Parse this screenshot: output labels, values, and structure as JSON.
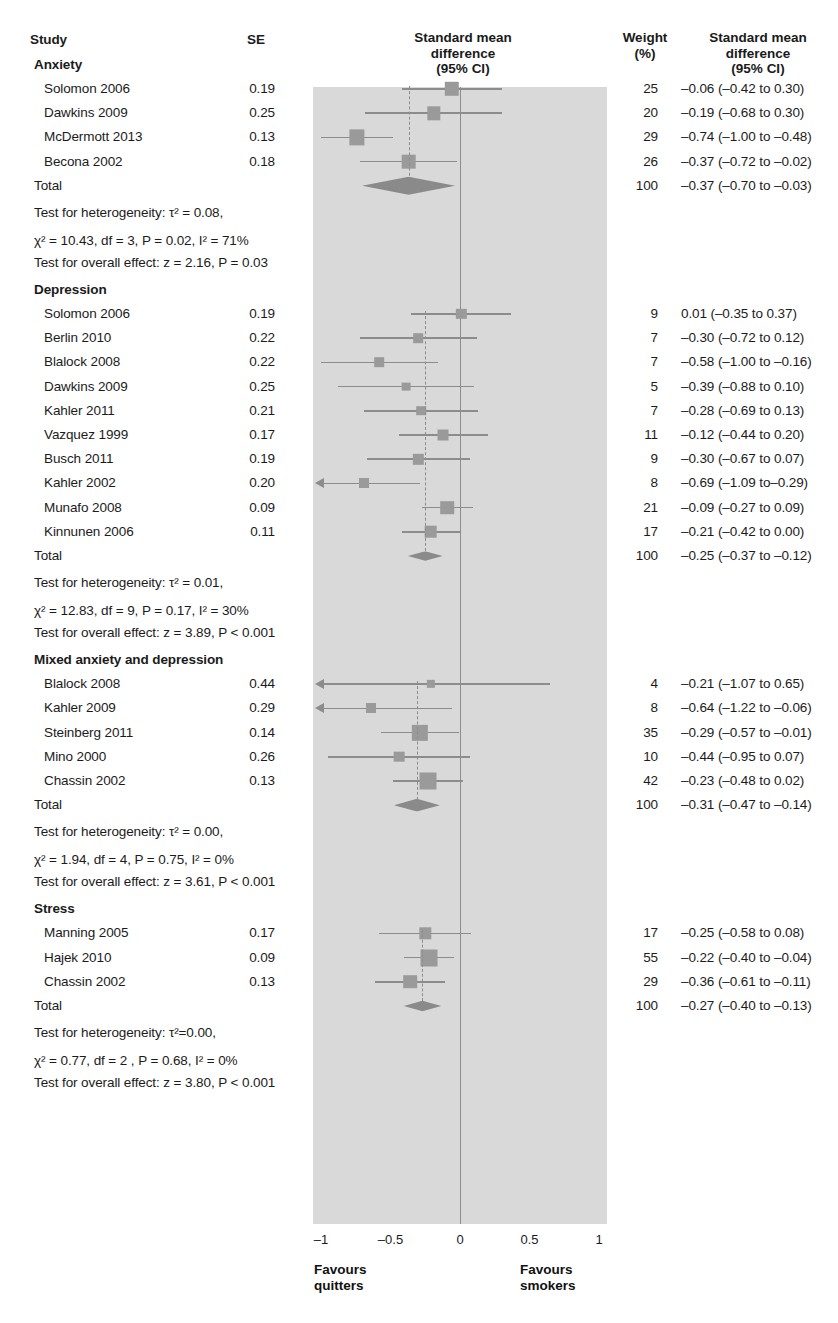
{
  "header": {
    "study": "Study",
    "se": "SE",
    "plot_title_line1": "Standard mean",
    "plot_title_line2": "difference",
    "plot_title_line3": "(95% CI)",
    "weight_line1": "Weight",
    "weight_line2": "(%)",
    "effect_line1": "Standard mean",
    "effect_line2": "difference",
    "effect_line3": "(95% CI)"
  },
  "axis": {
    "ticks": [
      "–1",
      "–0.5",
      "0",
      "0.5",
      "1"
    ],
    "tick_values": [
      -1,
      -0.5,
      0,
      0.5,
      1
    ],
    "favours_left_line1": "Favours",
    "favours_left_line2": "quitters",
    "favours_right_line1": "Favours",
    "favours_right_line2": "smokers"
  },
  "colors": {
    "plot_background": "#d9d9d9",
    "marker": "#9a9a9a",
    "line": "#8c8c8c",
    "diamond": "#8a8a8a",
    "text": "#1b1b1b"
  },
  "chart_data": {
    "type": "forest",
    "title": "Standard mean difference (95% CI)",
    "xlabel": "Standard mean difference",
    "xlim": [
      -1,
      1
    ],
    "grid": false,
    "null_line": 0,
    "groups": [
      {
        "name": "Anxiety",
        "studies": [
          {
            "study": "Solomon 2006",
            "se": "0.19",
            "weight": "25",
            "effect_text": "–0.06 (–0.42 to 0.30)",
            "estimate": -0.06,
            "ci_low": -0.42,
            "ci_high": 0.3,
            "weight_value": 25
          },
          {
            "study": "Dawkins 2009",
            "se": "0.25",
            "weight": "20",
            "effect_text": "–0.19 (–0.68 to 0.30)",
            "estimate": -0.19,
            "ci_low": -0.68,
            "ci_high": 0.3,
            "weight_value": 20
          },
          {
            "study": "McDermott 2013",
            "se": "0.13",
            "weight": "29",
            "effect_text": "–0.74 (–1.00 to –0.48)",
            "estimate": -0.74,
            "ci_low": -1.0,
            "ci_high": -0.48,
            "weight_value": 29
          },
          {
            "study": "Becona 2002",
            "se": "0.18",
            "weight": "26",
            "effect_text": "–0.37 (–0.72 to –0.02)",
            "estimate": -0.37,
            "ci_low": -0.72,
            "ci_high": -0.02,
            "weight_value": 26
          }
        ],
        "total": {
          "study": "Total",
          "weight": "100",
          "effect_text": "–0.37 (–0.70 to –0.03)",
          "estimate": -0.37,
          "ci_low": -0.7,
          "ci_high": -0.03
        },
        "heterogeneity_line1": "Test for heterogeneity: τ² = 0.08,",
        "heterogeneity_line2": "χ² = 10.43, df = 3, P = 0.02, I² = 71%",
        "overall_effect": "Test for overall effect: z = 2.16, P = 0.03"
      },
      {
        "name": "Depression",
        "studies": [
          {
            "study": "Solomon 2006",
            "se": "0.19",
            "weight": "9",
            "effect_text": "0.01 (–0.35 to 0.37)",
            "estimate": 0.01,
            "ci_low": -0.35,
            "ci_high": 0.37,
            "weight_value": 9
          },
          {
            "study": "Berlin 2010",
            "se": "0.22",
            "weight": "7",
            "effect_text": "–0.30 (–0.72 to 0.12)",
            "estimate": -0.3,
            "ci_low": -0.72,
            "ci_high": 0.12,
            "weight_value": 7
          },
          {
            "study": "Blalock 2008",
            "se": "0.22",
            "weight": "7",
            "effect_text": "–0.58 (–1.00 to –0.16)",
            "estimate": -0.58,
            "ci_low": -1.0,
            "ci_high": -0.16,
            "weight_value": 7
          },
          {
            "study": "Dawkins 2009",
            "se": "0.25",
            "weight": "5",
            "effect_text": "–0.39 (–0.88 to 0.10)",
            "estimate": -0.39,
            "ci_low": -0.88,
            "ci_high": 0.1,
            "weight_value": 5
          },
          {
            "study": "Kahler 2011",
            "se": "0.21",
            "weight": "7",
            "effect_text": "–0.28 (–0.69 to 0.13)",
            "estimate": -0.28,
            "ci_low": -0.69,
            "ci_high": 0.13,
            "weight_value": 7
          },
          {
            "study": "Vazquez 1999",
            "se": "0.17",
            "weight": "11",
            "effect_text": "–0.12 (–0.44 to 0.20)",
            "estimate": -0.12,
            "ci_low": -0.44,
            "ci_high": 0.2,
            "weight_value": 11
          },
          {
            "study": "Busch 2011",
            "se": "0.19",
            "weight": "9",
            "effect_text": "–0.30 (–0.67 to 0.07)",
            "estimate": -0.3,
            "ci_low": -0.67,
            "ci_high": 0.07,
            "weight_value": 9
          },
          {
            "study": "Kahler 2002",
            "se": "0.20",
            "weight": "8",
            "effect_text": "–0.69 (–1.09 to–0.29)",
            "estimate": -0.69,
            "ci_low": -1.09,
            "ci_high": -0.29,
            "weight_value": 8,
            "clipped_left": true
          },
          {
            "study": "Munafo 2008",
            "se": "0.09",
            "weight": "21",
            "effect_text": "–0.09 (–0.27 to 0.09)",
            "estimate": -0.09,
            "ci_low": -0.27,
            "ci_high": 0.09,
            "weight_value": 21
          },
          {
            "study": "Kinnunen 2006",
            "se": "0.11",
            "weight": "17",
            "effect_text": "–0.21 (–0.42 to 0.00)",
            "estimate": -0.21,
            "ci_low": -0.42,
            "ci_high": 0.0,
            "weight_value": 17
          }
        ],
        "total": {
          "study": "Total",
          "weight": "100",
          "effect_text": "–0.25 (–0.37 to –0.12)",
          "estimate": -0.25,
          "ci_low": -0.37,
          "ci_high": -0.12
        },
        "heterogeneity_line1": "Test for heterogeneity: τ² = 0.01,",
        "heterogeneity_line2": "χ² = 12.83, df = 9, P = 0.17, I² = 30%",
        "overall_effect": "Test for overall effect: z = 3.89, P < 0.001"
      },
      {
        "name": "Mixed anxiety and depression",
        "studies": [
          {
            "study": "Blalock 2008",
            "se": "0.44",
            "weight": "4",
            "effect_text": "–0.21 (–1.07 to 0.65)",
            "estimate": -0.21,
            "ci_low": -1.07,
            "ci_high": 0.65,
            "weight_value": 4,
            "clipped_left": true
          },
          {
            "study": "Kahler 2009",
            "se": "0.29",
            "weight": "8",
            "effect_text": "–0.64 (–1.22 to –0.06)",
            "estimate": -0.64,
            "ci_low": -1.22,
            "ci_high": -0.06,
            "weight_value": 8,
            "clipped_left": true
          },
          {
            "study": "Steinberg 2011",
            "se": "0.14",
            "weight": "35",
            "effect_text": "–0.29 (–0.57 to –0.01)",
            "estimate": -0.29,
            "ci_low": -0.57,
            "ci_high": -0.01,
            "weight_value": 35
          },
          {
            "study": "Mino 2000",
            "se": "0.26",
            "weight": "10",
            "effect_text": "–0.44 (–0.95 to 0.07)",
            "estimate": -0.44,
            "ci_low": -0.95,
            "ci_high": 0.07,
            "weight_value": 10
          },
          {
            "study": "Chassin 2002",
            "se": "0.13",
            "weight": "42",
            "effect_text": "–0.23 (–0.48 to 0.02)",
            "estimate": -0.23,
            "ci_low": -0.48,
            "ci_high": 0.02,
            "weight_value": 42
          }
        ],
        "total": {
          "study": "Total",
          "weight": "100",
          "effect_text": "–0.31 (–0.47 to –0.14)",
          "estimate": -0.31,
          "ci_low": -0.47,
          "ci_high": -0.14
        },
        "heterogeneity_line1": "Test for heterogeneity: τ² = 0.00,",
        "heterogeneity_line2": "χ² = 1.94, df = 4, P = 0.75, I² = 0%",
        "overall_effect": "Test for overall effect: z = 3.61, P < 0.001"
      },
      {
        "name": "Stress",
        "studies": [
          {
            "study": "Manning 2005",
            "se": "0.17",
            "weight": "17",
            "effect_text": "–0.25 (–0.58 to 0.08)",
            "estimate": -0.25,
            "ci_low": -0.58,
            "ci_high": 0.08,
            "weight_value": 17
          },
          {
            "study": "Hajek 2010",
            "se": "0.09",
            "weight": "55",
            "effect_text": "–0.22 (–0.40 to –0.04)",
            "estimate": -0.22,
            "ci_low": -0.4,
            "ci_high": -0.04,
            "weight_value": 55
          },
          {
            "study": "Chassin 2002",
            "se": "0.13",
            "weight": "29",
            "effect_text": "–0.36 (–0.61 to –0.11)",
            "estimate": -0.36,
            "ci_low": -0.61,
            "ci_high": -0.11,
            "weight_value": 29
          }
        ],
        "total": {
          "study": "Total",
          "weight": "100",
          "effect_text": "–0.27 (–0.40 to –0.13)",
          "estimate": -0.27,
          "ci_low": -0.4,
          "ci_high": -0.13
        },
        "heterogeneity_line1": "Test for heterogeneity: τ²=0.00,",
        "heterogeneity_line2": "χ² = 0.77, df = 2 , P = 0.68, I² = 0%",
        "overall_effect": "Test for overall effect: z = 3.80, P < 0.001"
      }
    ]
  }
}
